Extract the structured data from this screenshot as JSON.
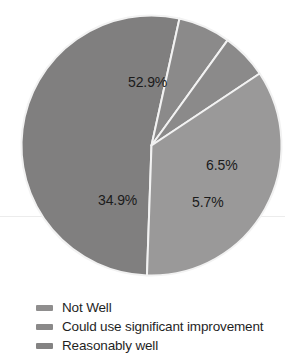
{
  "chart_data": {
    "type": "pie",
    "title": "",
    "subtitle": "",
    "xlabel": "",
    "ylabel": "",
    "grid": false,
    "legend_position": "bottom-left",
    "total": 100.0,
    "start_angle_deg": 182,
    "direction": "clockwise",
    "categories": [
      "Not Well",
      "Could use significant improvement",
      "Reasonably well",
      "Unlabeled"
    ],
    "values": [
      52.9,
      6.5,
      5.7,
      34.9
    ],
    "slices": [
      {
        "label": "52.9%",
        "value": 52.9,
        "color": "#807f7f",
        "legend_name": "Not Well"
      },
      {
        "label": "6.5%",
        "value": 6.5,
        "color": "#8b8a8a",
        "legend_name": "Could use significant improvement"
      },
      {
        "label": "5.7%",
        "value": 5.7,
        "color": "#8b8a8a",
        "legend_name": "Reasonably well"
      },
      {
        "label": "34.9%",
        "value": 34.9,
        "color": "#9a9999",
        "legend_name": ""
      }
    ]
  },
  "labels": {
    "slice_1": "52.9%",
    "slice_2": "6.5%",
    "slice_3": "5.7%",
    "slice_4": "34.9%"
  },
  "legend": {
    "items": [
      {
        "label": "Not Well",
        "color": "#8f8e8e"
      },
      {
        "label": "Could use significant improvement",
        "color": "#8a8989"
      },
      {
        "label": "Reasonably well",
        "color": "#848383"
      }
    ]
  },
  "colors": {
    "background": "#ffffff",
    "text": "#1b1b1b",
    "divider": "#f2f2f2",
    "rule": "#ececec"
  }
}
